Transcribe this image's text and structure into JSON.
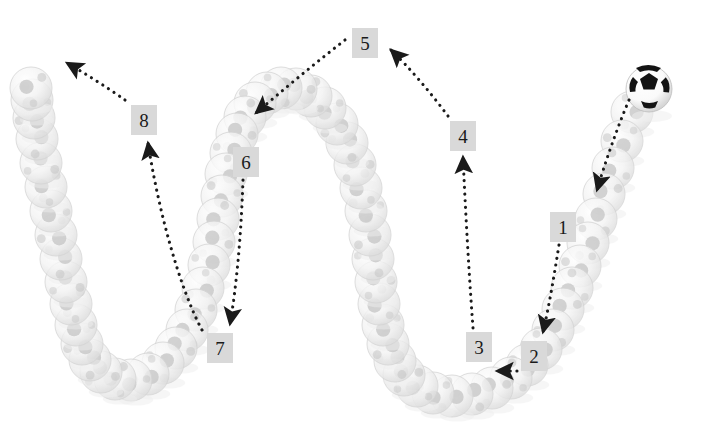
{
  "figure": {
    "width": 709,
    "height": 442,
    "background_color": "#ffffff"
  },
  "colors": {
    "label_box_fill": "#d9d9d9",
    "label_text": "#1a1a1a",
    "arrow": "#1a1a1a",
    "ball_ghost_light": "#f2f2f2",
    "ball_ghost_outline": "#d5d5d5",
    "ball_ghost_patch": "#c2c2c2",
    "ball_active_white": "#fdfdfd",
    "ball_active_patch": "#141414"
  },
  "labels": [
    {
      "id": "1",
      "text": "1",
      "x": 550,
      "y": 212
    },
    {
      "id": "2",
      "text": "2",
      "x": 521,
      "y": 341
    },
    {
      "id": "3",
      "text": "3",
      "x": 466,
      "y": 332
    },
    {
      "id": "4",
      "text": "4",
      "x": 450,
      "y": 121
    },
    {
      "id": "5",
      "text": "5",
      "x": 352,
      "y": 28
    },
    {
      "id": "6",
      "text": "6",
      "x": 233,
      "y": 147
    },
    {
      "id": "7",
      "text": "7",
      "x": 207,
      "y": 333
    },
    {
      "id": "8",
      "text": "8",
      "x": 131,
      "y": 105
    }
  ],
  "arrows": [
    {
      "name": "arrow-ball-to-1",
      "from_label": "ball",
      "to_label": "1",
      "style": "dotted",
      "direction": "down-left"
    },
    {
      "name": "arrow-1-to-2",
      "from_label": "1",
      "to_label": "2",
      "style": "dotted",
      "direction": "down-left"
    },
    {
      "name": "arrow-2-to-3",
      "from_label": "2",
      "to_label": "3",
      "style": "dotted",
      "direction": "left"
    },
    {
      "name": "arrow-3-to-4",
      "from_label": "3",
      "to_label": "4",
      "style": "dotted",
      "direction": "up"
    },
    {
      "name": "arrow-4-to-5",
      "from_label": "4",
      "to_label": "5",
      "style": "dotted",
      "direction": "up-left"
    },
    {
      "name": "arrow-5-to-6",
      "from_label": "5",
      "to_label": "6",
      "style": "dotted",
      "direction": "down-left"
    },
    {
      "name": "arrow-6-to-7",
      "from_label": "6",
      "to_label": "7",
      "style": "dotted",
      "direction": "down"
    },
    {
      "name": "arrow-7-to-8",
      "from_label": "7",
      "to_label": "8",
      "style": "dotted",
      "direction": "up-left"
    },
    {
      "name": "arrow-8-exit",
      "from_label": "8",
      "to_label": "exit",
      "style": "dotted",
      "direction": "up-left"
    }
  ],
  "balls": {
    "active_ball": {
      "x": 649,
      "y": 89,
      "r": 23,
      "state": "solid"
    },
    "trail_description": "Ghosted soccer balls tracing a bouncing path: descending from top-right into a right valley, rising over a central hump, descending into a left valley, then rising off the top-left."
  },
  "chart_data": {
    "type": "scatter",
    "xlabel": "",
    "ylabel": "",
    "xlim": [
      0,
      709
    ],
    "ylim": [
      442,
      0
    ],
    "grid": false,
    "legend": "none",
    "annotations": [
      "1",
      "2",
      "3",
      "4",
      "5",
      "6",
      "7",
      "8"
    ],
    "series": [
      {
        "name": "ball-trail",
        "points": [
          [
            632,
            112
          ],
          [
            622,
            141
          ],
          [
            613,
            168
          ],
          [
            604,
            194
          ],
          [
            596,
            219
          ],
          [
            588,
            243
          ],
          [
            580,
            266
          ],
          [
            572,
            288
          ],
          [
            563,
            309
          ],
          [
            553,
            330
          ],
          [
            541,
            349
          ],
          [
            527,
            365
          ],
          [
            511,
            378
          ],
          [
            492,
            388
          ],
          [
            472,
            394
          ],
          [
            452,
            396
          ],
          [
            433,
            393
          ],
          [
            417,
            386
          ],
          [
            404,
            375
          ],
          [
            395,
            361
          ],
          [
            388,
            344
          ],
          [
            383,
            325
          ],
          [
            379,
            304
          ],
          [
            376,
            282
          ],
          [
            373,
            259
          ],
          [
            370,
            235
          ],
          [
            366,
            211
          ],
          [
            361,
            188
          ],
          [
            355,
            165
          ],
          [
            347,
            143
          ],
          [
            337,
            124
          ],
          [
            325,
            108
          ],
          [
            311,
            96
          ],
          [
            296,
            89
          ],
          [
            281,
            88
          ],
          [
            267,
            93
          ],
          [
            255,
            103
          ],
          [
            245,
            117
          ],
          [
            237,
            134
          ],
          [
            231,
            153
          ],
          [
            226,
            174
          ],
          [
            222,
            196
          ],
          [
            218,
            219
          ],
          [
            214,
            242
          ],
          [
            209,
            265
          ],
          [
            203,
            288
          ],
          [
            196,
            310
          ],
          [
            187,
            330
          ],
          [
            176,
            348
          ],
          [
            163,
            363
          ],
          [
            148,
            374
          ],
          [
            131,
            380
          ],
          [
            115,
            379
          ],
          [
            101,
            372
          ],
          [
            90,
            360
          ],
          [
            82,
            344
          ],
          [
            76,
            325
          ],
          [
            71,
            304
          ],
          [
            66,
            282
          ],
          [
            61,
            259
          ],
          [
            56,
            235
          ],
          [
            51,
            211
          ],
          [
            46,
            187
          ],
          [
            41,
            163
          ],
          [
            37,
            139
          ],
          [
            34,
            118
          ],
          [
            32,
            100
          ],
          [
            31,
            88
          ]
        ]
      }
    ]
  }
}
